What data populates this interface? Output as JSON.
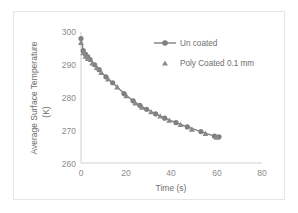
{
  "chart_data": {
    "type": "line",
    "title": "",
    "xlabel": "Time (s)",
    "ylabel": "Average Surface Temperature (K)",
    "ylabel_line1": "Average Surface Temperature",
    "ylabel_line2": "(K)",
    "xlim": [
      0,
      80
    ],
    "ylim": [
      260,
      300
    ],
    "xticks": [
      0,
      20,
      40,
      60,
      80
    ],
    "yticks": [
      260,
      270,
      280,
      290,
      300
    ],
    "grid": false,
    "legend_position": "upper-right-inside",
    "series": [
      {
        "name": "Un coated",
        "marker": "circle",
        "color": "#808080",
        "line": true,
        "x": [
          0,
          1,
          2,
          3,
          4,
          6,
          8,
          11,
          14,
          19,
          23,
          26,
          29,
          33,
          37,
          42,
          47,
          53,
          59,
          61
        ],
        "y": [
          298.0,
          294.3,
          293.2,
          292.4,
          291.6,
          290.0,
          288.5,
          286.3,
          284.5,
          281.2,
          279.0,
          277.6,
          276.4,
          275.0,
          273.7,
          272.3,
          271.0,
          269.6,
          268.2,
          268.0
        ]
      },
      {
        "name": "Poly Coated 0.1 mm",
        "marker": "triangle",
        "color": "#8a8a8a",
        "line": false,
        "x": [
          0,
          1,
          2,
          3,
          5,
          7,
          9,
          12,
          16,
          20,
          24,
          27,
          31,
          35,
          39,
          44,
          49,
          55,
          60
        ],
        "y": [
          296.8,
          293.6,
          292.6,
          291.9,
          290.5,
          289.1,
          287.6,
          285.6,
          283.2,
          280.5,
          278.3,
          277.0,
          275.6,
          274.3,
          273.0,
          271.7,
          270.3,
          269.0,
          267.8
        ]
      }
    ]
  },
  "colors": {
    "series_gray": "#808080",
    "axis_gray": "#d0d0d0",
    "text_gray": "#8c8c8c",
    "frame_gray": "#e6e6e6"
  }
}
